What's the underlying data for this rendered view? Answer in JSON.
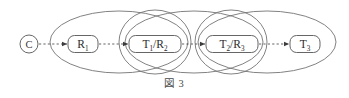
{
  "figure": {
    "caption_label": "図",
    "caption_number": "3",
    "caption_full": "図 3"
  },
  "colors": {
    "stroke": "#555555",
    "ellipse_stroke": "#6b6b6b",
    "text": "#2b2b2b",
    "background": "#ffffff",
    "arrow": "#3c3c3c"
  },
  "diagram": {
    "type": "state-transition-chain",
    "start_node": {
      "id": "start",
      "label": "C",
      "shape": "circle",
      "cx": 29,
      "cy": 44,
      "r": 9
    },
    "nodes": [
      {
        "id": "node-r1",
        "main": "R",
        "sub": "1",
        "label": "R₁",
        "shape": "rounded-rect",
        "cx": 83,
        "cy": 44,
        "w": 30,
        "h": 17
      },
      {
        "id": "node-t1-r2",
        "main": "T",
        "sub": "1",
        "separator": "/",
        "main2": "R",
        "sub2": "2",
        "label": "T₁/R₂",
        "shape": "rounded-rect",
        "cx": 155,
        "cy": 44,
        "w": 52,
        "h": 17
      },
      {
        "id": "node-t2-r3",
        "main": "T",
        "sub": "2",
        "separator": "/",
        "main2": "R",
        "sub2": "3",
        "label": "T₂/R₃",
        "shape": "rounded-rect",
        "cx": 232,
        "cy": 44,
        "w": 52,
        "h": 17
      },
      {
        "id": "node-t3",
        "main": "T",
        "sub": "3",
        "label": "T₃",
        "shape": "rounded-rect",
        "cx": 305,
        "cy": 44,
        "w": 30,
        "h": 17
      }
    ],
    "arrows": [
      {
        "id": "arrow-start-r1",
        "from": "start",
        "to": "node-r1",
        "x1": 39,
        "x2": 67,
        "y": 44,
        "style": "dashed"
      },
      {
        "id": "arrow-r1-t1r2",
        "from": "node-r1",
        "to": "node-t1-r2",
        "x1": 99,
        "x2": 128,
        "y": 44,
        "style": "dashed"
      },
      {
        "id": "arrow-t1r2-t2r3",
        "from": "node-t1-r2",
        "to": "node-t2-r3",
        "x1": 182,
        "x2": 205,
        "y": 44,
        "style": "dashed"
      },
      {
        "id": "arrow-t2r3-t3",
        "from": "node-t2-r3",
        "to": "node-t3",
        "x1": 259,
        "x2": 289,
        "y": 44,
        "style": "dashed"
      }
    ],
    "outer_ellipses": [
      {
        "id": "outer-ellipse-1",
        "cx": 119,
        "cy": 42,
        "rx": 69,
        "ry": 31
      },
      {
        "id": "outer-ellipse-2",
        "cx": 194,
        "cy": 42,
        "rx": 69,
        "ry": 31
      },
      {
        "id": "outer-ellipse-3",
        "cx": 267,
        "cy": 42,
        "rx": 69,
        "ry": 31
      }
    ],
    "inner_ellipses": [
      {
        "id": "inner-ellipse-1",
        "cx": 155,
        "cy": 42,
        "rx": 36,
        "ry": 32
      },
      {
        "id": "inner-ellipse-2",
        "cx": 231,
        "cy": 42,
        "rx": 36,
        "ry": 32
      }
    ]
  }
}
